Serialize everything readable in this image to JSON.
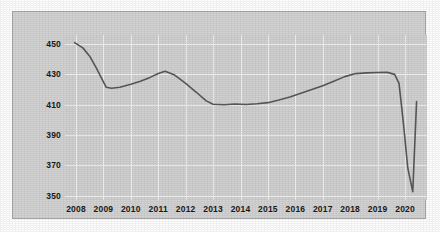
{
  "chart_data": {
    "type": "line",
    "title": "",
    "subtitle": "",
    "xlabel": "",
    "ylabel": "",
    "grid": true,
    "legend": null,
    "legend_position": "none",
    "line_color": "#595959",
    "plot_background": "#d2d2d2",
    "gridline_color": "#f2f2f2",
    "panel_background": "#d4d4d4",
    "panel_border": "#a8a8a8",
    "xlim": [
      2007.6,
      2020.8
    ],
    "ylim": [
      347,
      456
    ],
    "yticks": [
      450,
      430,
      410,
      390,
      370,
      350
    ],
    "ytick_labels": [
      "450",
      "430",
      "410",
      "390",
      "370",
      "350"
    ],
    "xticks": [
      2008,
      2009,
      2010,
      2011,
      2012,
      2013,
      2014,
      2015,
      2016,
      2017,
      2018,
      2019,
      2020
    ],
    "xtick_labels": [
      "2008",
      "2009",
      "2010",
      "2011",
      "2012",
      "2013",
      "2014",
      "2015",
      "2016",
      "2017",
      "2018",
      "2019",
      "2020"
    ],
    "x": [
      2007.95,
      2008.25,
      2008.5,
      2008.75,
      2009.0,
      2009.1,
      2009.3,
      2009.6,
      2010.0,
      2010.35,
      2010.7,
      2011.0,
      2011.25,
      2011.6,
      2012.0,
      2012.4,
      2012.75,
      2013.0,
      2013.4,
      2013.8,
      2014.2,
      2014.6,
      2015.0,
      2015.4,
      2015.8,
      2016.2,
      2016.6,
      2017.0,
      2017.4,
      2017.8,
      2018.2,
      2018.6,
      2019.0,
      2019.35,
      2019.62,
      2019.78,
      2019.95,
      2020.1,
      2020.28,
      2020.42
    ],
    "values": [
      451.0,
      447.5,
      442.0,
      434.0,
      425.0,
      421.5,
      420.8,
      421.5,
      423.5,
      425.5,
      428.0,
      430.5,
      432.0,
      429.5,
      424.0,
      418.0,
      412.5,
      410.3,
      409.9,
      410.4,
      410.1,
      410.6,
      411.3,
      413.0,
      415.0,
      417.5,
      420.0,
      422.5,
      425.5,
      428.5,
      430.5,
      431.0,
      431.2,
      431.3,
      430.0,
      424.0,
      396.0,
      368.0,
      352.5,
      412.0
    ],
    "annotations": []
  }
}
